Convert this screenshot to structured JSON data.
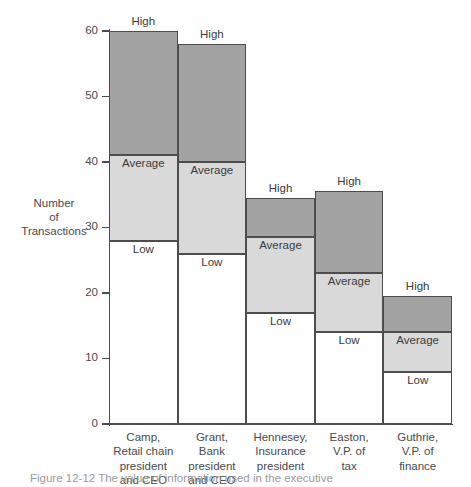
{
  "chart_data": {
    "type": "bar",
    "title": "",
    "subtitle": "",
    "xlabel": "",
    "ylabel": "Number\nof\nTransactions",
    "ylim": [
      0,
      60
    ],
    "yticks": [
      0,
      10,
      20,
      30,
      40,
      50,
      60
    ],
    "ytick_labels": [
      "0",
      "10",
      "20",
      "30",
      "40",
      "50",
      "60"
    ],
    "grid": false,
    "legend": "none",
    "stacked": true,
    "bar_gap": 0,
    "segment_names": [
      "Low",
      "Average",
      "High"
    ],
    "segment_colors": {
      "low": "#ffffff",
      "average": "#d9d9d9",
      "high": "#a3a3a3"
    },
    "categories": [
      "Camp,\nRetail chain\npresident\nand CEO",
      "Grant,\nBank\npresident\nand CEO",
      "Hennesey,\nInsurance\npresident",
      "Easton,\nV.P. of\ntax",
      "Guthrie,\nV.P. of\nfinance"
    ],
    "series": [
      {
        "name": "Low",
        "values": [
          28,
          26,
          17,
          14,
          8
        ]
      },
      {
        "name": "Average",
        "values": [
          41,
          40,
          28.5,
          23,
          14
        ]
      },
      {
        "name": "High",
        "values": [
          60,
          58,
          34.5,
          35.5,
          19.5
        ]
      }
    ],
    "bars": [
      {
        "category": "Camp,\nRetail chain\npresident\nand CEO",
        "low_top": 28,
        "average_top": 41,
        "high_top": 60,
        "labels": {
          "low": "Low",
          "average": "Average",
          "high": "High"
        }
      },
      {
        "category": "Grant,\nBank\npresident\nand CEO",
        "low_top": 26,
        "average_top": 40,
        "high_top": 58,
        "labels": {
          "low": "Low",
          "average": "Average",
          "high": "High"
        }
      },
      {
        "category": "Hennesey,\nInsurance\npresident",
        "low_top": 17,
        "average_top": 28.5,
        "high_top": 34.5,
        "labels": {
          "low": "Low",
          "average": "Average",
          "high": "High"
        }
      },
      {
        "category": "Easton,\nV.P. of\ntax",
        "low_top": 14,
        "average_top": 23,
        "high_top": 35.5,
        "labels": {
          "low": "Low",
          "average": "Average",
          "high": "High"
        }
      },
      {
        "category": "Guthrie,\nV.P. of\nfinance",
        "low_top": 8,
        "average_top": 14,
        "high_top": 19.5,
        "labels": {
          "low": "Low",
          "average": "Average",
          "high": "High"
        }
      }
    ]
  },
  "figure": {
    "caption": "Figure 12-12   The value of information used in the executive"
  }
}
